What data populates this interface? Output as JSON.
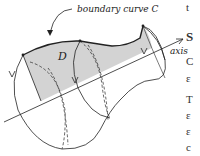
{
  "figure": {
    "labels": {
      "boundary": "boundary curve C",
      "region": "D",
      "axis": "axis"
    }
  },
  "side_text": {
    "lines": [
      "t",
      "S",
      "C",
      "ε",
      "T",
      "ε",
      "ε",
      "c"
    ]
  }
}
